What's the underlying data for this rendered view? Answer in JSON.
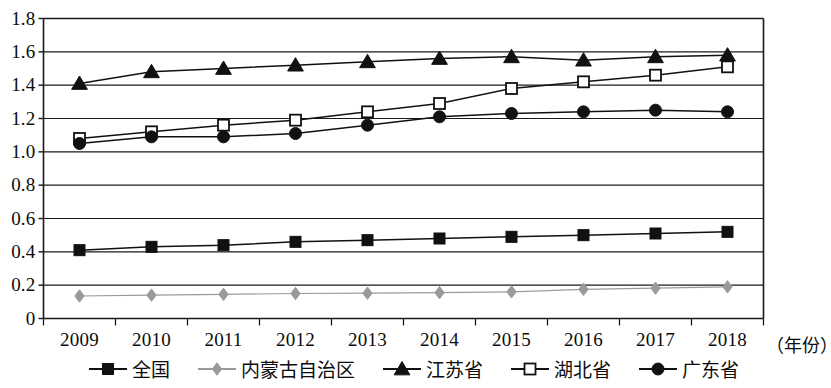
{
  "chart_data": {
    "type": "line",
    "title": "",
    "xlabel": "（年份）",
    "ylabel": "",
    "x": [
      2009,
      2010,
      2011,
      2012,
      2013,
      2014,
      2015,
      2016,
      2017,
      2018
    ],
    "xtick_labels": [
      "2009",
      "2010",
      "2011",
      "2012",
      "2013",
      "2014",
      "2015",
      "2016",
      "2017",
      "2018"
    ],
    "ylim": [
      0,
      1.8
    ],
    "ytick_values": [
      0,
      0.2,
      0.4,
      0.6,
      0.8,
      1.0,
      1.2,
      1.4,
      1.6,
      1.8
    ],
    "ytick_labels": [
      "0",
      "0.2",
      "0.4",
      "0.6",
      "0.8",
      "1.0",
      "1.2",
      "1.4",
      "1.6",
      "1.8"
    ],
    "grid": true,
    "legend_position": "bottom",
    "series": [
      {
        "name": "全国",
        "marker": "filled-square",
        "color": "#111111",
        "line_style": "solid",
        "values": [
          0.41,
          0.43,
          0.44,
          0.46,
          0.47,
          0.48,
          0.49,
          0.5,
          0.51,
          0.52
        ]
      },
      {
        "name": "内蒙古自治区",
        "marker": "filled-diamond",
        "color": "#9a9a9a",
        "line_style": "solid",
        "values": [
          0.135,
          0.14,
          0.145,
          0.15,
          0.152,
          0.155,
          0.16,
          0.175,
          0.182,
          0.19
        ]
      },
      {
        "name": "江苏省",
        "marker": "filled-triangle",
        "color": "#111111",
        "line_style": "solid",
        "values": [
          1.41,
          1.48,
          1.5,
          1.52,
          1.54,
          1.56,
          1.57,
          1.55,
          1.57,
          1.58
        ]
      },
      {
        "name": "湖北省",
        "marker": "open-square",
        "color": "#111111",
        "line_style": "solid",
        "values": [
          1.08,
          1.12,
          1.16,
          1.19,
          1.24,
          1.29,
          1.38,
          1.42,
          1.46,
          1.51
        ]
      },
      {
        "name": "广东省",
        "marker": "filled-circle",
        "color": "#111111",
        "line_style": "solid",
        "values": [
          1.05,
          1.09,
          1.09,
          1.11,
          1.16,
          1.21,
          1.23,
          1.24,
          1.25,
          1.24
        ]
      }
    ]
  },
  "legend": {
    "items": [
      {
        "label": "全国",
        "marker": "filled-square",
        "color": "#111111"
      },
      {
        "label": "内蒙古自治区",
        "marker": "filled-diamond",
        "color": "#9a9a9a"
      },
      {
        "label": "江苏省",
        "marker": "filled-triangle",
        "color": "#111111"
      },
      {
        "label": "湖北省",
        "marker": "open-square",
        "color": "#111111"
      },
      {
        "label": "广东省",
        "marker": "filled-circle",
        "color": "#111111"
      }
    ]
  }
}
